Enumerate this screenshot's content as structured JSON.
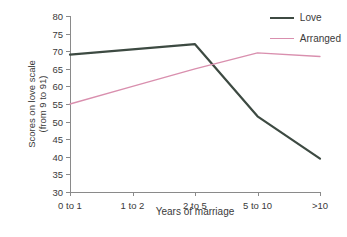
{
  "chart_data": {
    "type": "line",
    "title": "",
    "xlabel": "Years of marriage",
    "ylabel": "Scores on love scale (from 9 to 91)",
    "ylabel_line1": "Scores on love scale",
    "ylabel_line2": "(from 9 to 91)",
    "categories": [
      "0 to 1",
      "1 to 2",
      "2 to 5",
      "5 to 10",
      ">10"
    ],
    "ylim": [
      30,
      80
    ],
    "yticks": [
      30,
      35,
      40,
      45,
      50,
      55,
      60,
      65,
      70,
      75,
      80
    ],
    "grid": false,
    "legend_position": "top-right",
    "series": [
      {
        "name": "Love",
        "color": "#3d4a42",
        "width": 2.2,
        "values": [
          69,
          70.5,
          72,
          51.5,
          39.5
        ]
      },
      {
        "name": "Arranged",
        "color": "#d98fae",
        "width": 1.3,
        "values": [
          55,
          60,
          65,
          69.5,
          68.5
        ]
      }
    ]
  },
  "legend": {
    "items": [
      {
        "label": "Love",
        "color": "#3d4a42",
        "width": 2.2
      },
      {
        "label": "Arranged",
        "color": "#d98fae",
        "width": 1.3
      }
    ]
  },
  "colors": {
    "axis": "#8a8a8a",
    "text": "#3a3a3a",
    "background": "#ffffff",
    "love": "#3d4a42",
    "arranged": "#d98fae"
  }
}
